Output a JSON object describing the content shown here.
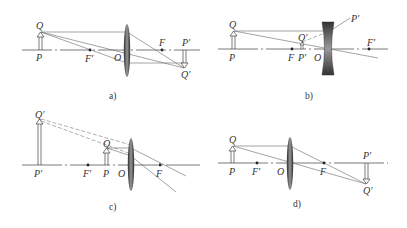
{
  "figure": {
    "panels": [
      {
        "id": "a",
        "caption": "a)",
        "lens_type": "convex",
        "labels": {
          "Q": "Q",
          "P": "P",
          "F_prime": "F′",
          "O": "O",
          "F": "F",
          "P_image": "P′",
          "Q_image": "Q′"
        }
      },
      {
        "id": "b",
        "caption": "b)",
        "lens_type": "concave",
        "labels": {
          "Q": "Q",
          "P": "P",
          "F": "F",
          "P_image": "P′",
          "Q_image": "Q′",
          "O": "O",
          "F_prime": "F′",
          "P_upper": "P′"
        }
      },
      {
        "id": "c",
        "caption": "c)",
        "lens_type": "convex",
        "labels": {
          "Q_image": "Q′",
          "P_image": "P′",
          "F_prime": "F′",
          "P": "P",
          "Q": "Q",
          "O": "O",
          "F": "F"
        }
      },
      {
        "id": "d",
        "caption": "d)",
        "lens_type": "convex",
        "labels": {
          "Q": "Q",
          "P": "P",
          "F_prime": "F′",
          "O": "O",
          "F": "F",
          "P_image": "P′",
          "Q_image": "Q′"
        }
      }
    ],
    "colors": {
      "lens_dark": "#3a3a3a",
      "lens_light": "#9a9a9a",
      "ray": "#666666",
      "axis": "#555555"
    }
  }
}
